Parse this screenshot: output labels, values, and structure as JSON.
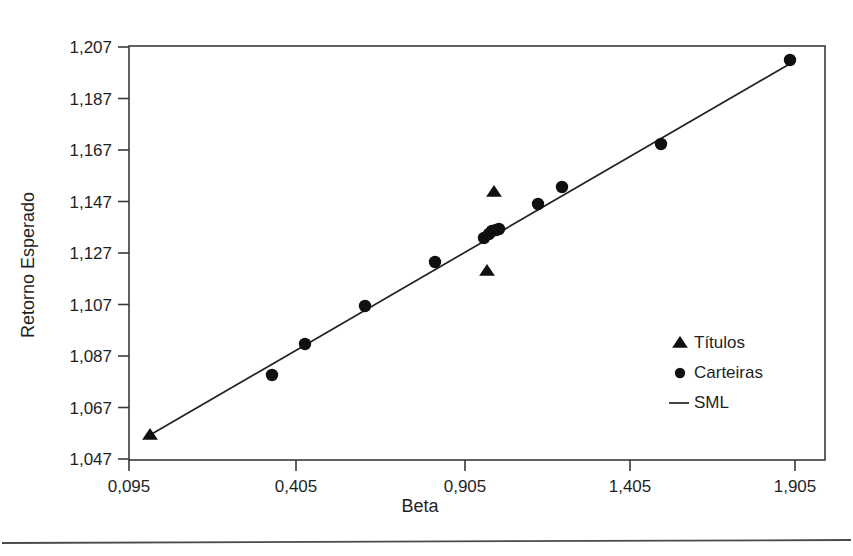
{
  "chart_data": {
    "type": "scatter",
    "title": "",
    "xlabel": "Beta",
    "ylabel": "Retorno Esperado",
    "xlim": [
      0.095,
      1.905
    ],
    "ylim": [
      1.047,
      1.207
    ],
    "grid": false,
    "legend_position": "center-right",
    "x_tick_labels": [
      "0,095",
      "0,405",
      "0,905",
      "1,405",
      "1,905"
    ],
    "x_tick_values": [
      0.095,
      0.405,
      0.905,
      1.405,
      1.905
    ],
    "x_tick_px": [
      129,
      296,
      465,
      630,
      795
    ],
    "y_tick_labels": [
      "1,207",
      "1,187",
      "1,167",
      "1,147",
      "1,127",
      "1,107",
      "1,087",
      "1,067",
      "1,047"
    ],
    "y_tick_values": [
      1.207,
      1.187,
      1.167,
      1.147,
      1.127,
      1.107,
      1.087,
      1.067,
      1.047
    ],
    "y_tick_px": [
      47,
      98.5,
      150,
      201.5,
      253,
      304.5,
      356,
      407.5,
      459
    ],
    "plot_area_px": {
      "left": 129,
      "top": 46,
      "right": 825,
      "bottom": 460
    },
    "series": [
      {
        "name": "Títulos",
        "marker": "triangle",
        "points": [
          {
            "x": 0.135,
            "y": 1.0535,
            "px": 150,
            "py": 435
          },
          {
            "x": 0.965,
            "y": 1.1475,
            "px": 494,
            "py": 192
          },
          {
            "x": 0.945,
            "y": 1.1205,
            "px": 487,
            "py": 271
          }
        ]
      },
      {
        "name": "Carteiras",
        "marker": "circle",
        "points": [
          {
            "x": 0.355,
            "y": 1.0775,
            "px": 272,
            "py": 375
          },
          {
            "x": 0.415,
            "y": 1.0895,
            "px": 305,
            "py": 344
          },
          {
            "x": 0.585,
            "y": 1.1045,
            "px": 365,
            "py": 306
          },
          {
            "x": 0.815,
            "y": 1.1225,
            "px": 435,
            "py": 262
          },
          {
            "x": 0.935,
            "y": 1.1315,
            "px": 484,
            "py": 238
          },
          {
            "x": 0.95,
            "y": 1.133,
            "px": 489,
            "py": 234
          },
          {
            "x": 0.958,
            "y": 1.134,
            "px": 492,
            "py": 231
          },
          {
            "x": 0.968,
            "y": 1.1345,
            "px": 496,
            "py": 230
          },
          {
            "x": 0.978,
            "y": 1.135,
            "px": 499,
            "py": 229
          },
          {
            "x": 1.095,
            "y": 1.1455,
            "px": 538,
            "py": 204
          },
          {
            "x": 1.17,
            "y": 1.1515,
            "px": 562,
            "py": 187
          },
          {
            "x": 1.475,
            "y": 1.169,
            "px": 661,
            "py": 144
          },
          {
            "x": 1.89,
            "y": 1.202,
            "px": 790,
            "py": 60
          }
        ]
      },
      {
        "name": "SML",
        "marker": "line",
        "line_px": {
          "x1": 150,
          "y1": 435,
          "x2": 793,
          "y2": 62
        }
      }
    ]
  },
  "legend": {
    "items": [
      {
        "label": "Títulos",
        "marker": "triangle"
      },
      {
        "label": "Carteiras",
        "marker": "circle"
      },
      {
        "label": "SML",
        "marker": "line"
      }
    ]
  },
  "axes": {
    "x_title": "Beta",
    "y_title": "Retorno Esperado"
  }
}
